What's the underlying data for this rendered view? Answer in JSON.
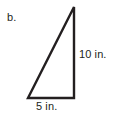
{
  "figure": {
    "part_label": "b.",
    "shape": "right-triangle",
    "stroke_color": "#231f20",
    "background_color": "#ffffff",
    "text_color": "#231f20",
    "labels": {
      "vertical_leg": "10 in.",
      "base_leg": "5 in."
    },
    "measurements": {
      "height_value": 10,
      "height_unit": "in.",
      "base_value": 5,
      "base_unit": "in."
    },
    "vertices": {
      "apex": [
        74,
        7
      ],
      "bottom_right": [
        74,
        98
      ],
      "bottom_left": [
        28,
        98
      ]
    }
  }
}
